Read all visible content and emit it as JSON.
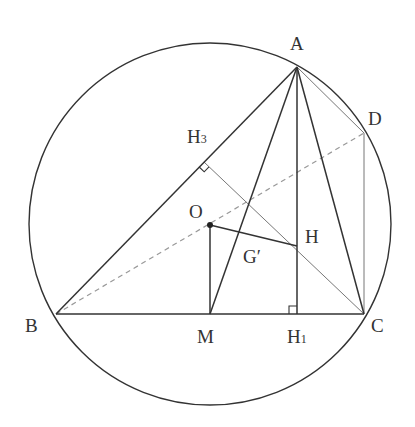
{
  "diagram": {
    "type": "geometry",
    "colors": {
      "stroke": "#333333",
      "thin_stroke": "#777777",
      "dashed": "#999999",
      "background": "#ffffff"
    },
    "circle": {
      "cx": 210,
      "cy": 224,
      "r": 181
    },
    "points": {
      "A": {
        "x": 297,
        "y": 67
      },
      "B": {
        "x": 56,
        "y": 314
      },
      "C": {
        "x": 364,
        "y": 314
      },
      "D": {
        "x": 364,
        "y": 133
      },
      "O": {
        "x": 210,
        "y": 225
      },
      "H": {
        "x": 297,
        "y": 246
      },
      "M": {
        "x": 210,
        "y": 314
      },
      "H1": {
        "x": 297,
        "y": 314
      },
      "H3": {
        "x": 204,
        "y": 162
      }
    },
    "labels": [
      {
        "id": "A",
        "text": "A",
        "sub": "",
        "x": 290,
        "y": 50
      },
      {
        "id": "B",
        "text": "B",
        "sub": "",
        "x": 25,
        "y": 332
      },
      {
        "id": "C",
        "text": "C",
        "sub": "",
        "x": 371,
        "y": 332
      },
      {
        "id": "D",
        "text": "D",
        "sub": "",
        "x": 368,
        "y": 125
      },
      {
        "id": "O",
        "text": "O",
        "sub": "",
        "x": 189,
        "y": 218
      },
      {
        "id": "H",
        "text": "H",
        "sub": "",
        "x": 305,
        "y": 243
      },
      {
        "id": "G",
        "text": "G′",
        "sub": "",
        "x": 243,
        "y": 263
      },
      {
        "id": "M",
        "text": "M",
        "sub": "",
        "x": 197,
        "y": 343
      },
      {
        "id": "H1",
        "text": "H",
        "sub": "1",
        "x": 287,
        "y": 343
      },
      {
        "id": "H3",
        "text": "H",
        "sub": "3",
        "x": 187,
        "y": 143
      }
    ],
    "segments": [
      {
        "from": "A",
        "to": "B",
        "style": "solid"
      },
      {
        "from": "B",
        "to": "C",
        "style": "solid"
      },
      {
        "from": "A",
        "to": "C",
        "style": "solid"
      },
      {
        "from": "A",
        "to": "M",
        "style": "solid"
      },
      {
        "from": "A",
        "to": "H1",
        "style": "solid"
      },
      {
        "from": "O",
        "to": "M",
        "style": "solid"
      },
      {
        "from": "O",
        "to": "H",
        "style": "solid"
      },
      {
        "from": "A",
        "to": "D",
        "style": "thin"
      },
      {
        "from": "D",
        "to": "C",
        "style": "thin"
      },
      {
        "from": "H3",
        "to": "C",
        "style": "thin"
      },
      {
        "from": "B",
        "to": "D",
        "style": "dashed"
      }
    ],
    "right_angle_marks": [
      "H1",
      "H3"
    ]
  }
}
